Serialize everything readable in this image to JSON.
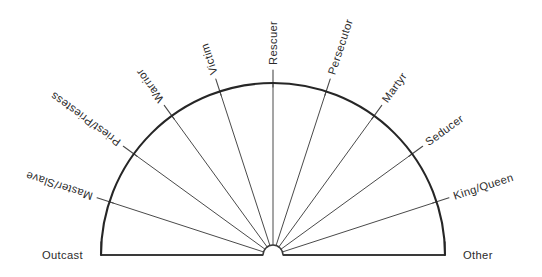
{
  "diagram": {
    "kind": "radial-fan-semicircle",
    "title": "",
    "background_color": "#ffffff",
    "line_color": "#2b2b2b",
    "text_color": "#2b2b2b",
    "geometry": {
      "center_x": 273,
      "center_y": 255,
      "radius": 172,
      "hub_radius": 10,
      "tick_overshoot": 13,
      "angle_start_deg": 180,
      "angle_end_deg": 0,
      "angle_step_deg": 18,
      "spoke_count": 11
    },
    "labels": [
      {
        "id": "outcast",
        "text": "Outcast",
        "angle_deg": 180,
        "rotation_deg": 0
      },
      {
        "id": "master-slave",
        "text": "Master/Slave",
        "angle_deg": 162,
        "rotation_deg": -18
      },
      {
        "id": "priest-priestess",
        "text": "Priest/Priestess",
        "angle_deg": 144,
        "rotation_deg": -36
      },
      {
        "id": "warrior",
        "text": "Warrior",
        "angle_deg": 126,
        "rotation_deg": -54
      },
      {
        "id": "victim",
        "text": "Victim",
        "angle_deg": 108,
        "rotation_deg": -72
      },
      {
        "id": "rescuer",
        "text": "Rescuer",
        "angle_deg": 90,
        "rotation_deg": -90
      },
      {
        "id": "persecutor",
        "text": "Persecutor",
        "angle_deg": 72,
        "rotation_deg": -108
      },
      {
        "id": "martyr",
        "text": "Martyr",
        "angle_deg": 54,
        "rotation_deg": -126
      },
      {
        "id": "seducer",
        "text": "Seducer",
        "angle_deg": 36,
        "rotation_deg": -144
      },
      {
        "id": "king-queen",
        "text": "King/Queen",
        "angle_deg": 18,
        "rotation_deg": -162
      },
      {
        "id": "other",
        "text": "Other",
        "angle_deg": 0,
        "rotation_deg": 0
      }
    ]
  }
}
